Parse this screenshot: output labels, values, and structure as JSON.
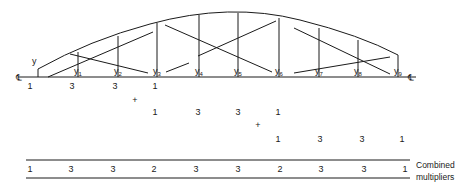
{
  "diagram": {
    "type": "arch-truss-simpsons-rule",
    "centerline_symbol": "℄",
    "ordinates": [
      {
        "label": "y",
        "sub": "",
        "x": 38,
        "top": 69
      },
      {
        "label": "y",
        "sub": "1",
        "x": 78,
        "top": 52
      },
      {
        "label": "y",
        "sub": "2",
        "x": 118,
        "top": 36
      },
      {
        "label": "y",
        "sub": "3",
        "x": 157,
        "top": 23
      },
      {
        "label": "y",
        "sub": "4",
        "x": 199,
        "top": 15
      },
      {
        "label": "y",
        "sub": "5",
        "x": 238,
        "top": 13
      },
      {
        "label": "y",
        "sub": "6",
        "x": 279,
        "top": 18
      },
      {
        "label": "y",
        "sub": "7",
        "x": 319,
        "top": 28
      },
      {
        "label": "y",
        "sub": "8",
        "x": 358,
        "top": 40
      },
      {
        "label": "y",
        "sub": "9",
        "x": 398,
        "top": 55
      }
    ],
    "multiplier_rows": [
      {
        "values": [
          {
            "v": "1",
            "x": 30
          },
          {
            "v": "3",
            "x": 72
          },
          {
            "v": "3",
            "x": 115
          },
          {
            "v": "1",
            "x": 155
          }
        ],
        "y": 89
      },
      {
        "values": [
          {
            "v": "1",
            "x": 155
          },
          {
            "v": "3",
            "x": 198
          },
          {
            "v": "3",
            "x": 238
          },
          {
            "v": "1",
            "x": 278
          }
        ],
        "y": 115
      },
      {
        "values": [
          {
            "v": "1",
            "x": 278
          },
          {
            "v": "3",
            "x": 320
          },
          {
            "v": "3",
            "x": 362
          },
          {
            "v": "1",
            "x": 402
          }
        ],
        "y": 142
      }
    ],
    "plus_signs": [
      {
        "symbol": "+",
        "x": 135,
        "y": 103
      },
      {
        "symbol": "+",
        "x": 258,
        "y": 128
      }
    ],
    "combined": {
      "values": [
        "1",
        "3",
        "3",
        "2",
        "3",
        "3",
        "2",
        "3",
        "3",
        "1"
      ],
      "label_line1": "Combined",
      "label_line2": "multipliers"
    }
  }
}
